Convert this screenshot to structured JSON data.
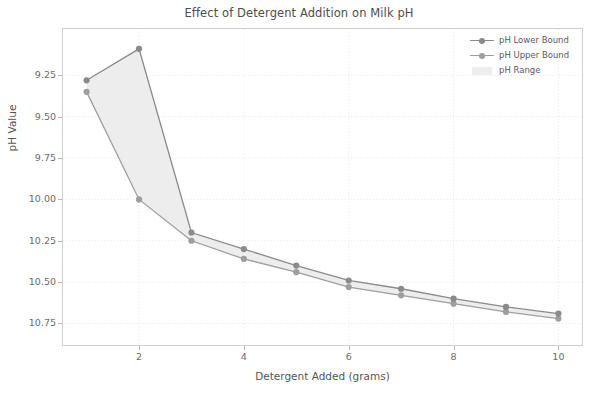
{
  "chart_data": {
    "type": "line",
    "title": "Effect of Detergent Addition on Milk pH",
    "xlabel": "Detergent Added (grams)",
    "ylabel": "pH Value",
    "x": [
      1,
      2,
      3,
      4,
      5,
      6,
      7,
      8,
      9,
      10
    ],
    "xtick_labels": [
      "2",
      "4",
      "6",
      "8",
      "10"
    ],
    "xticks": [
      2,
      4,
      6,
      8,
      10
    ],
    "ytick_labels": [
      "9.25",
      "9.50",
      "9.75",
      "10.00",
      "10.25",
      "10.50",
      "10.75"
    ],
    "yticks": [
      9.25,
      9.5,
      9.75,
      10.0,
      10.25,
      10.5,
      10.75
    ],
    "xlim": [
      0.55,
      10.45
    ],
    "ylim": [
      10.88,
      8.97
    ],
    "y_axis_inverted": true,
    "grid": true,
    "legend_position": "upper right outside",
    "series": [
      {
        "name": "pH Lower Bound",
        "values": [
          9.28,
          9.09,
          10.2,
          10.3,
          10.4,
          10.49,
          10.54,
          10.6,
          10.65,
          10.69
        ],
        "color": "#8a8a8a",
        "marker": "circle"
      },
      {
        "name": "pH Upper Bound",
        "values": [
          9.35,
          10.0,
          10.25,
          10.36,
          10.44,
          10.53,
          10.58,
          10.63,
          10.68,
          10.72
        ],
        "color": "#9e9e9e",
        "marker": "circle"
      }
    ],
    "band": {
      "name": "pH Range",
      "color": "#ededed",
      "between": [
        "pH Lower Bound",
        "pH Upper Bound"
      ]
    }
  },
  "legend": {
    "items": [
      {
        "label": "pH Lower Bound"
      },
      {
        "label": "pH Upper Bound"
      },
      {
        "label": "pH Range"
      }
    ]
  },
  "colors": {
    "lower": "#8a8a8a",
    "upper": "#9e9e9e",
    "band": "#ededed",
    "grid": "#e6e6e6",
    "axis": "#cfcfcf",
    "text": "#555555"
  }
}
